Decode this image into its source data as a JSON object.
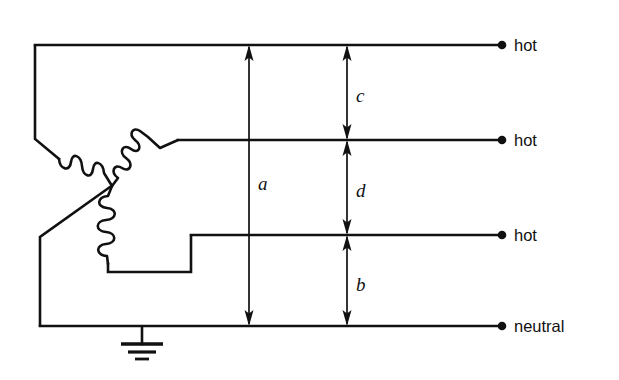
{
  "diagram": {
    "type": "electrical-schematic",
    "stroke_color": "#111111",
    "background_color": "#ffffff",
    "terminals": [
      {
        "id": "hot-1",
        "label": "hot",
        "line_y": 45,
        "dot_x": 502,
        "label_x": 514,
        "label_y": 38
      },
      {
        "id": "hot-2",
        "label": "hot",
        "line_y": 140,
        "dot_x": 502,
        "label_x": 514,
        "label_y": 133
      },
      {
        "id": "hot-3",
        "label": "hot",
        "line_y": 235,
        "dot_x": 502,
        "label_x": 514,
        "label_y": 228
      },
      {
        "id": "neutral",
        "label": "neutral",
        "line_y": 326,
        "dot_x": 502,
        "label_x": 514,
        "label_y": 319
      }
    ],
    "dimensions": [
      {
        "id": "dim-a",
        "label": "a",
        "x": 249,
        "y_top": 45,
        "y_bottom": 326,
        "label_x": 258,
        "label_y": 174,
        "arrow_top": true,
        "arrow_bottom": true
      },
      {
        "id": "dim-c",
        "label": "c",
        "x": 347,
        "y_top": 45,
        "y_bottom": 140,
        "label_x": 356,
        "label_y": 86,
        "arrow_top": true,
        "arrow_bottom": true
      },
      {
        "id": "dim-d",
        "label": "d",
        "x": 347,
        "y_top": 140,
        "y_bottom": 235,
        "label_x": 356,
        "label_y": 181,
        "arrow_top": true,
        "arrow_bottom": true
      },
      {
        "id": "dim-b",
        "label": "b",
        "x": 347,
        "y_top": 235,
        "y_bottom": 326,
        "label_x": 356,
        "label_y": 275,
        "arrow_top": true,
        "arrow_bottom": true
      }
    ],
    "ground": {
      "id": "earth-ground",
      "stem_x": 142,
      "stem_top": 326,
      "stem_bottom": 344,
      "bars": [
        {
          "half_width": 21,
          "y": 344,
          "width": 3.4
        },
        {
          "half_width": 14,
          "y": 352,
          "width": 3.0
        },
        {
          "half_width": 7,
          "y": 359,
          "width": 2.8
        }
      ]
    },
    "windings": [
      {
        "id": "winding-left",
        "turns": 4,
        "orientation": "diagonal-down-right"
      },
      {
        "id": "winding-top",
        "turns": 4,
        "orientation": "diagonal-up-right"
      },
      {
        "id": "winding-center-tapped",
        "turns": 4,
        "orientation": "vertical"
      }
    ],
    "wire_paths": {
      "hot1_bus": "M 35,45 L 502,45",
      "hot2_bus": "M 178,140 L 502,140",
      "hot3_bus": "M 191,235 L 502,235",
      "neutral_bus": "M 40,326 L 502,326",
      "left_riser": "M 35,45 L 35,139",
      "left_drop": "M 40,236 L 40,326",
      "delta_left_lead": "M 35,139 L 58,158",
      "delta_bottom_lead": "M 40,236 L 108,188",
      "tap_lead": "M 108,266 L 108,272 L 191,272 L 191,235"
    }
  }
}
